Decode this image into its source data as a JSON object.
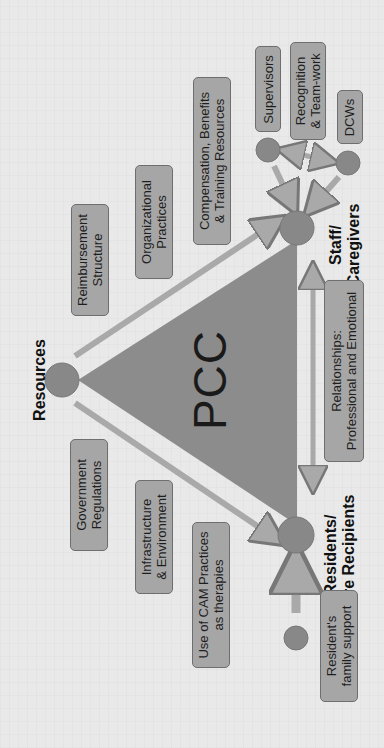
{
  "diagram": {
    "center_label": "PCC",
    "nodes": {
      "resources": "Resources",
      "staff": "Staff/\nCaregivers",
      "residents": "Residents/\nCare Recipients"
    },
    "boxes": {
      "reimbursement": "Reimbursement\nStructure",
      "organizational": "Organizational\nPractices",
      "compensation": "Compensation, Benefits\n& Training Resources",
      "supervisors": "Supervisors",
      "recognition": "Recognition\n& Team-work",
      "dcws": "DCWs",
      "relationships": "Relationships:\nProfessional and Emotional",
      "government": "Government\nRegulations",
      "infrastructure": "Infrastructure\n& Environment",
      "cam": "Use of CAM Practices\nas therapies",
      "family": "Resident's\nfamily support"
    },
    "colors": {
      "background": "#e9e9e9",
      "triangle": "#8c8c8c",
      "node": "#888888",
      "box": "#a6a6a6",
      "arrow": "#a9a9a9"
    }
  }
}
